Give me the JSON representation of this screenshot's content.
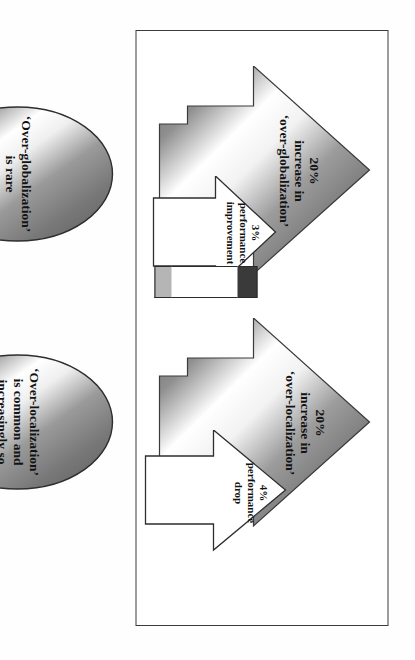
{
  "diagram": {
    "frame": {
      "label": "diagram-border"
    },
    "groups": [
      {
        "id": "globalization",
        "big_arrow": {
          "line1": "20%",
          "line2": "increase in",
          "line3": "‘over-globalization’"
        },
        "small_arrow": {
          "pct": "3%",
          "line2": "performance",
          "line3": "improvement"
        }
      },
      {
        "id": "localization",
        "big_arrow": {
          "line1": "20%",
          "line2": "increase in",
          "line3": "‘over-localization’"
        },
        "small_arrow": {
          "pct": "4%",
          "line2": "performance",
          "line3": "drop"
        }
      }
    ],
    "ellipses": [
      {
        "id": "globalization",
        "line1": "‘Over-globalization’",
        "line2": "is rare",
        "line3": ""
      },
      {
        "id": "localization",
        "line1": "‘Over-localization’",
        "line2": "is common and",
        "line3": "increasingly so"
      }
    ],
    "colors": {
      "frame_border": "#3b3b3b",
      "metal_dark": "#6e6e6e",
      "metal_mid": "#9d9d9d",
      "metal_light": "#ffffff",
      "outline": "#2e2e2e",
      "bar_dark": "#3a3a3a",
      "bar_light": "#b5b5b5",
      "text": "#121212",
      "page": "#ffffff"
    }
  }
}
